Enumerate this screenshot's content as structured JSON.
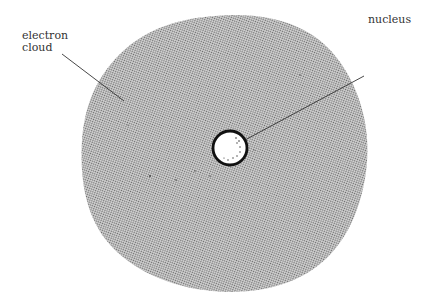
{
  "diagram": {
    "labels": {
      "electron_cloud": [
        "electron",
        "cloud"
      ],
      "nucleus": "nucleus"
    },
    "colors": {
      "background": "#ffffff",
      "cloud_dot": "#555555",
      "cloud_fill": "#d4d4d4",
      "nucleus_fill": "#ffffff",
      "nucleus_stroke": "#111111",
      "leader_line": "#333333"
    }
  }
}
